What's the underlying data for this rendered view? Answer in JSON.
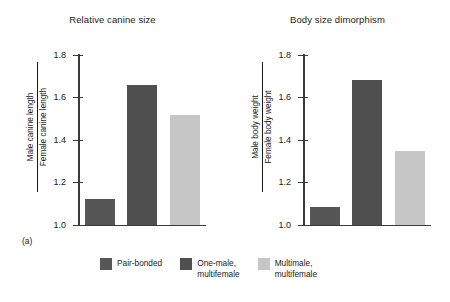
{
  "chart_data": [
    {
      "type": "bar",
      "panel": "(a)",
      "title": "Relative canine size",
      "ylabel_numerator": "Male canine length",
      "ylabel_denominator": "Female canine length",
      "categories": [
        "Pair-bonded",
        "One-male, multifemale",
        "Multimale, multifemale"
      ],
      "values": [
        1.12,
        1.65,
        1.51
      ],
      "ylim": [
        1.0,
        1.8
      ],
      "yticks": [
        "1.0",
        "1.2",
        "1.4",
        "1.6",
        "1.8"
      ],
      "ytick_values": [
        1.0,
        1.2,
        1.4,
        1.6,
        1.8
      ],
      "xlabel": "",
      "grid": false
    },
    {
      "type": "bar",
      "panel": "(b)",
      "title": "Body size dimorphism",
      "ylabel_numerator": "Male body weight",
      "ylabel_denominator": "Female body weight",
      "categories": [
        "Pair-bonded",
        "One-male, multifemale",
        "Multimale, multifemale"
      ],
      "values": [
        1.08,
        1.67,
        1.34
      ],
      "ylim": [
        1.0,
        1.8
      ],
      "yticks": [
        "1.0",
        "1.2",
        "1.4",
        "1.6",
        "1.8"
      ],
      "ytick_values": [
        1.0,
        1.2,
        1.4,
        1.6,
        1.8
      ],
      "xlabel": "",
      "grid": false
    }
  ],
  "legend": {
    "position": "bottom-center",
    "items": [
      {
        "label": "Pair-bonded",
        "color": "#565656"
      },
      {
        "label": "One-male,\nmultifemale",
        "color": "#4f4f4f"
      },
      {
        "label": "Multimale,\nmultifemale",
        "color": "#c6c6c6"
      }
    ]
  },
  "colors": {
    "bar_pair_bonded": "#565656",
    "bar_one_male": "#4f4f4f",
    "bar_multimale": "#c6c6c6",
    "axis": "#3a3a3a",
    "text": "#1a1a1a",
    "background": "#ffffff"
  }
}
